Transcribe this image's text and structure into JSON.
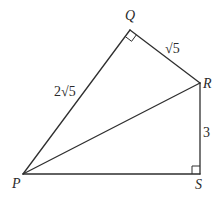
{
  "diagram": {
    "type": "geometry",
    "vertices": {
      "P": {
        "label": "P",
        "x": 23,
        "y": 174
      },
      "Q": {
        "label": "Q",
        "x": 130,
        "y": 30
      },
      "R": {
        "label": "R",
        "x": 200,
        "y": 83
      },
      "S": {
        "label": "S",
        "x": 200,
        "y": 174
      }
    },
    "segments": [
      {
        "from": "P",
        "to": "Q",
        "length_label": "2√5"
      },
      {
        "from": "Q",
        "to": "R",
        "length_label": "√5"
      },
      {
        "from": "R",
        "to": "S",
        "length_label": "3"
      },
      {
        "from": "S",
        "to": "P",
        "length_label": ""
      },
      {
        "from": "P",
        "to": "R",
        "length_label": ""
      }
    ],
    "right_angles": [
      "Q",
      "S"
    ],
    "labels": {
      "P": "P",
      "Q": "Q",
      "R": "R",
      "S": "S",
      "PQ": "2√5",
      "QR": "√5",
      "RS": "3"
    },
    "colors": {
      "line": "#2f2f2f",
      "text": "#2a2a2a",
      "background": "#ffffff"
    }
  }
}
